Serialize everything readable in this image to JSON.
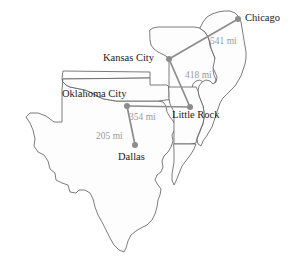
{
  "figure": {
    "kind": "us-states-distance-map",
    "background_color": "#ffffff",
    "outline_color": "#5a5a5a",
    "fill_color": "#fdfdfd",
    "route_color": "#8c8c8c",
    "marker_color": "#8c8c8c",
    "city_text_color": "#1b1b1b",
    "distance_text_color": "#9a9a9a"
  },
  "cities": [
    {
      "name": "Chicago",
      "label": "Chicago",
      "x": 238,
      "y": 19,
      "label_x": 245,
      "label_y": 13
    },
    {
      "name": "Kansas City",
      "label": "Kansas City",
      "x": 169,
      "y": 59,
      "label_x": 103,
      "label_y": 53
    },
    {
      "name": "Oklahoma City",
      "label": "Oklahoma City",
      "x": 127,
      "y": 106,
      "label_x": 62,
      "label_y": 89
    },
    {
      "name": "Little Rock",
      "label": "Little Rock",
      "x": 190,
      "y": 107,
      "label_x": 172,
      "label_y": 110
    },
    {
      "name": "Dallas",
      "label": "Dallas",
      "x": 135,
      "y": 145,
      "label_x": 118,
      "label_y": 152
    }
  ],
  "routes": [
    {
      "from": "Kansas City",
      "to": "Chicago",
      "label": "541 mi",
      "label_x": 210,
      "label_y": 37
    },
    {
      "from": "Kansas City",
      "to": "Little Rock",
      "label": "418 mi",
      "label_x": 185,
      "label_y": 71
    },
    {
      "from": "Oklahoma City",
      "to": "Little Rock",
      "label": "354 mi",
      "label_x": 129,
      "label_y": 113
    },
    {
      "from": "Oklahoma City",
      "to": "Dallas",
      "label": "205 mi",
      "label_x": 96,
      "label_y": 132
    }
  ],
  "states": [
    {
      "name": "texas",
      "label": "Texas"
    },
    {
      "name": "oklahoma",
      "label": "Oklahoma"
    },
    {
      "name": "missouri",
      "label": "Missouri"
    },
    {
      "name": "arkansas",
      "label": "Arkansas"
    },
    {
      "name": "illinois",
      "label": "Illinois"
    },
    {
      "name": "louisiana",
      "label": "Louisiana"
    }
  ]
}
